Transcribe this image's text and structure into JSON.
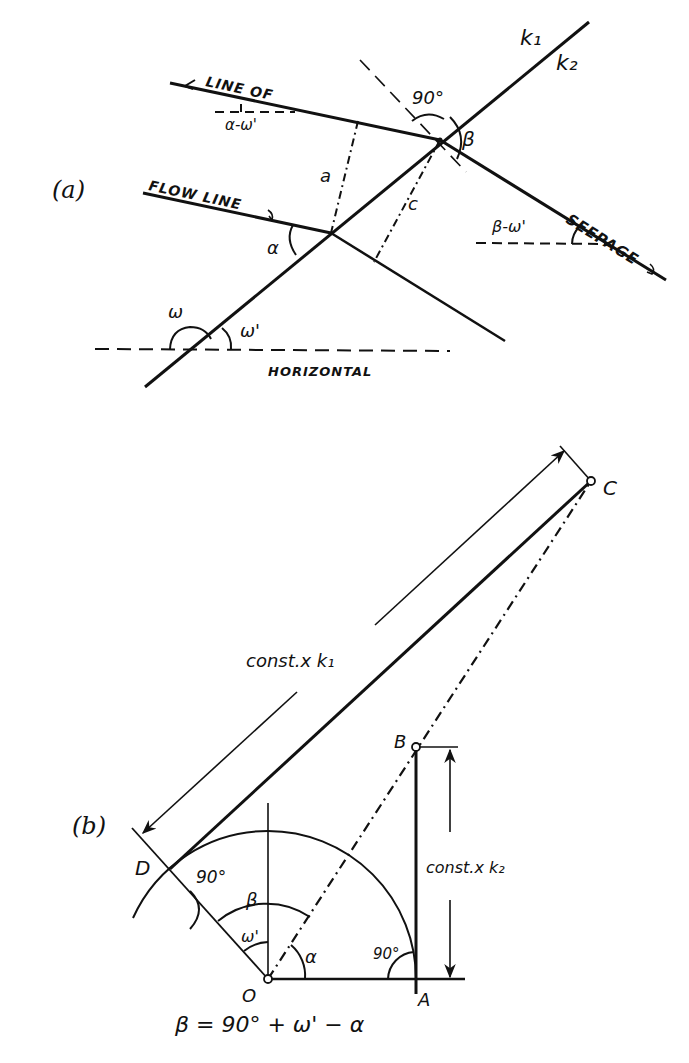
{
  "figure": {
    "panel_a": {
      "label": "(a)",
      "texts": {
        "line_of": "LINE OF",
        "flow_line": "FLOW LINE",
        "seepage": "SEEPAGE",
        "horizontal": "HORIZONTAL",
        "k1": "k₁",
        "k2": "k₂",
        "angle_90": "90°",
        "beta": "β",
        "alpha": "α",
        "a": "a",
        "c": "c",
        "omega": "ω",
        "omega_prime": "ω'",
        "alpha_minus_omega": "α-ω'",
        "beta_minus_omega": "β-ω'"
      }
    },
    "panel_b": {
      "label": "(b)",
      "points": {
        "O": "O",
        "A": "A",
        "B": "B",
        "C": "C",
        "D": "D"
      },
      "texts": {
        "const_k1": "const.x k₁",
        "const_k2": "const.x k₂",
        "angle_90_d": "90°",
        "angle_90_a": "90°",
        "beta": "β",
        "omega_prime": "ω'",
        "alpha": "α",
        "formula": "β = 90° + ω' − α"
      }
    }
  }
}
